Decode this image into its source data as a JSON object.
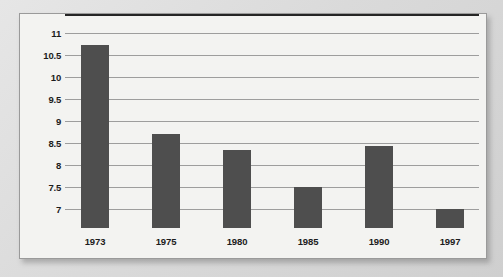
{
  "chart_data": {
    "type": "bar",
    "title": "",
    "subtitle": "",
    "xlabel": "",
    "ylabel": "",
    "categories": [
      "1973",
      "1975",
      "1980",
      "1985",
      "1990",
      "1997"
    ],
    "values": [
      10.73,
      8.7,
      8.33,
      7.5,
      8.43,
      7.0
    ],
    "series": [
      {
        "name": "",
        "values": [
          10.73,
          8.7,
          8.33,
          7.5,
          8.43,
          7.0
        ]
      }
    ],
    "ylim": [
      6.6,
      11
    ],
    "y_ticks": [
      11,
      10.5,
      10,
      9.5,
      9,
      8.5,
      8,
      7.5,
      7
    ],
    "y_tick_labels": [
      "11",
      "10.5",
      "10",
      "9.5",
      "9",
      "8.5",
      "8",
      "7.5",
      "7"
    ],
    "grid": true,
    "grid_axis": "y",
    "legend": false,
    "legend_position": "none",
    "bar_color": "#4e4e4e",
    "gridline_color": "#9d9d9d",
    "axis_color": "#252525",
    "plot_background": "#f3f3f1",
    "page_background": "#dcdcdc",
    "annotations": []
  }
}
